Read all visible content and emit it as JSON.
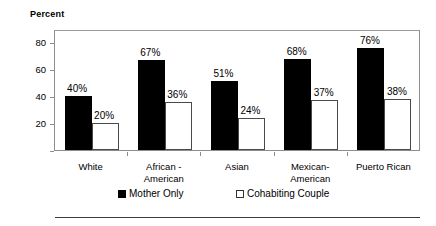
{
  "chart_data": {
    "type": "bar",
    "title": "",
    "ylabel": "Percent",
    "xlabel": "",
    "ylim": [
      0,
      90
    ],
    "yticks": [
      20,
      40,
      60,
      80
    ],
    "ytick_labels": [
      "20",
      "40",
      "60",
      "80"
    ],
    "grid": false,
    "legend_position": "bottom",
    "categories": [
      "White",
      "African - American",
      "Asian",
      "Mexican- American",
      "Puerto Rican"
    ],
    "category_lines": [
      [
        "White"
      ],
      [
        "African -",
        "American"
      ],
      [
        "Asian"
      ],
      [
        "Mexican-",
        "American"
      ],
      [
        "Puerto Rican"
      ]
    ],
    "series": [
      {
        "name": "Mother Only",
        "color": "#000000",
        "values": [
          40,
          67,
          51,
          68,
          76
        ],
        "labels": [
          "40%",
          "67%",
          "51%",
          "68%",
          "76%"
        ]
      },
      {
        "name": "Cohabiting Couple",
        "color": "#ffffff",
        "values": [
          20,
          36,
          24,
          37,
          38
        ],
        "labels": [
          "20%",
          "36%",
          "24%",
          "37%",
          "38%"
        ]
      }
    ]
  },
  "legend": {
    "items": [
      {
        "label": "Mother Only",
        "swatch": "filled-square-icon"
      },
      {
        "label": "Cohabiting Couple",
        "swatch": "open-square-icon"
      }
    ]
  }
}
